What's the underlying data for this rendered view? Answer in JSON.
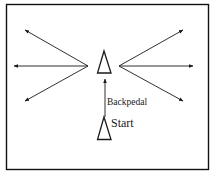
{
  "diagram": {
    "type": "drill-diagram",
    "labels": {
      "backpedal": "Backpedal",
      "start": "Start"
    },
    "colors": {
      "stroke": "#1a1a1a",
      "frame": "#111111",
      "background": "#ffffff"
    },
    "cones": [
      {
        "id": "top-cone",
        "role": "turn-point"
      },
      {
        "id": "start-cone",
        "role": "start"
      }
    ],
    "arrows": [
      {
        "id": "backpedal",
        "direction": "up"
      },
      {
        "id": "left-up",
        "direction": "up-left"
      },
      {
        "id": "left",
        "direction": "left"
      },
      {
        "id": "left-down",
        "direction": "down-left"
      },
      {
        "id": "right-up",
        "direction": "up-right"
      },
      {
        "id": "right",
        "direction": "right"
      },
      {
        "id": "right-down",
        "direction": "down-right"
      }
    ]
  }
}
